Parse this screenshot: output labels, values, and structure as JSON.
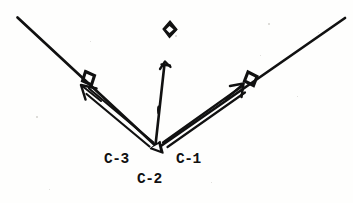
{
  "figure": {
    "kind": "scanned-line-diagram",
    "background_color": "#fefefd",
    "ink_color": "#111111",
    "width": 353,
    "height": 203,
    "labels": [
      {
        "id": "c3",
        "text": "C-3",
        "x": 104,
        "y": 152,
        "role": "left-arm-label"
      },
      {
        "id": "c1",
        "text": "C-1",
        "x": 176,
        "y": 152,
        "role": "right-arm-label"
      },
      {
        "id": "c2",
        "text": "C-2",
        "x": 137,
        "y": 172,
        "role": "apex-label"
      }
    ],
    "apex": {
      "x": 158,
      "y": 148
    },
    "arms": [
      {
        "name": "left-arm",
        "from": {
          "x": 17,
          "y": 17
        },
        "to": {
          "x": 158,
          "y": 148
        },
        "marker": {
          "type": "square-marker",
          "x": 89,
          "y": 78
        },
        "arrow": {
          "type": "outline-arrow",
          "tail": {
            "x": 152,
            "y": 143
          },
          "head": {
            "x": 82,
            "y": 82
          },
          "direction": "up-left"
        }
      },
      {
        "name": "right-arm",
        "from": {
          "x": 158,
          "y": 148
        },
        "to": {
          "x": 345,
          "y": 18
        },
        "marker": {
          "type": "square-marker",
          "x": 251,
          "y": 78
        },
        "arrow": {
          "type": "outline-arrow",
          "tail": {
            "x": 164,
            "y": 143
          },
          "head": {
            "x": 244,
            "y": 84
          },
          "direction": "up-right"
        }
      }
    ],
    "center_arrow": {
      "name": "center-arrow",
      "tail": {
        "x": 155,
        "y": 144
      },
      "head": {
        "x": 165,
        "y": 62
      },
      "direction": "up"
    },
    "apex_wedge": {
      "type": "filled-triangle",
      "x": 158,
      "y": 148
    },
    "top_diamond": {
      "type": "diamond-marker",
      "x": 170,
      "y": 29
    },
    "speckles": [
      {
        "x": 36,
        "y": 116,
        "d": 1.6
      },
      {
        "x": 268,
        "y": 23,
        "d": 1.6
      },
      {
        "x": 318,
        "y": 32,
        "d": 1.4
      },
      {
        "x": 90,
        "y": 41,
        "d": 1.3
      },
      {
        "x": 260,
        "y": 55,
        "d": 1.4
      },
      {
        "x": 211,
        "y": 182,
        "d": 1.4
      },
      {
        "x": 175,
        "y": 35,
        "d": 1.5
      },
      {
        "x": 49,
        "y": 189,
        "d": 1.3
      },
      {
        "x": 297,
        "y": 96,
        "d": 1.3
      }
    ]
  }
}
